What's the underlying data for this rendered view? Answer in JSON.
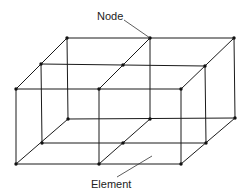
{
  "diagram": {
    "type": "finite-element-mesh",
    "labels": {
      "node": "Node",
      "element": "Element"
    },
    "colors": {
      "line": "#1a1a1a",
      "node": "#111111",
      "background": "#ffffff"
    },
    "nodes": [
      {
        "id": "bt0",
        "x": 67,
        "y": 38
      },
      {
        "id": "bt1",
        "x": 150,
        "y": 38
      },
      {
        "id": "bt2",
        "x": 234,
        "y": 38
      },
      {
        "id": "mt0",
        "x": 41,
        "y": 64
      },
      {
        "id": "mt1",
        "x": 123,
        "y": 65
      },
      {
        "id": "mt2",
        "x": 205,
        "y": 66
      },
      {
        "id": "ft0",
        "x": 16,
        "y": 89
      },
      {
        "id": "ft1",
        "x": 99,
        "y": 89
      },
      {
        "id": "ft2",
        "x": 181,
        "y": 89
      },
      {
        "id": "bb0",
        "x": 68,
        "y": 119
      },
      {
        "id": "bb1",
        "x": 150,
        "y": 119
      },
      {
        "id": "bb2",
        "x": 235,
        "y": 118
      },
      {
        "id": "mb0",
        "x": 42,
        "y": 143
      },
      {
        "id": "mb1",
        "x": 123,
        "y": 143
      },
      {
        "id": "mb2",
        "x": 206,
        "y": 143
      },
      {
        "id": "fb0",
        "x": 16,
        "y": 164
      },
      {
        "id": "fb1",
        "x": 99,
        "y": 164
      },
      {
        "id": "fb2",
        "x": 181,
        "y": 164
      }
    ]
  }
}
